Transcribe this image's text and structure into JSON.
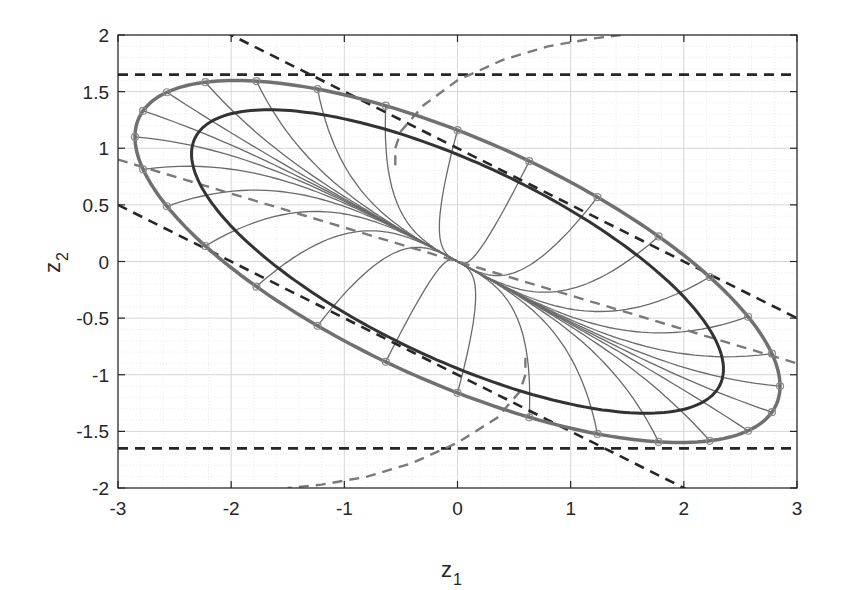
{
  "chart_data": {
    "type": "line",
    "title": "",
    "xlabel": "z",
    "xlabel_sub": "1",
    "ylabel": "z",
    "ylabel_sub": "2",
    "xlim": [
      -3,
      3
    ],
    "ylim": [
      -2,
      2
    ],
    "xticks": [
      -3,
      -2,
      -1,
      0,
      1,
      2,
      3
    ],
    "xtick_labels": [
      "-3",
      "-2",
      "-1",
      "0",
      "1",
      "2",
      "3"
    ],
    "yticks": [
      -2,
      -1.5,
      -1,
      -0.5,
      0,
      0.5,
      1,
      1.5,
      2
    ],
    "ytick_labels": [
      "-2",
      "-1.5",
      "-1",
      "-0.5",
      "0",
      "0.5",
      "1",
      "1.5",
      "2"
    ],
    "grid": "major+minor",
    "legend": null,
    "series": [
      {
        "name": "outer ellipse (with markers)",
        "kind": "ellipse",
        "color": "#707070",
        "width": 3.5,
        "param": {
          "X": 2.85,
          "Y1": 1.1,
          "Y2": 1.16
        },
        "markers": "circle",
        "marker_count": 28
      },
      {
        "name": "inner ellipse",
        "kind": "ellipse",
        "color": "#333333",
        "width": 3,
        "param": {
          "X": 2.35,
          "Y1": 0.95,
          "Y2": 0.945
        }
      },
      {
        "name": "trajectories",
        "kind": "trajectories",
        "color": "#6a6a6a",
        "width": 1.3,
        "count": 28,
        "converge_to": [
          0,
          0
        ]
      },
      {
        "name": "upper bound horizontal",
        "kind": "hline",
        "y": 1.65,
        "color": "#262626",
        "dash": "dashed"
      },
      {
        "name": "lower bound horizontal",
        "kind": "hline",
        "y": -1.65,
        "color": "#262626",
        "dash": "dashed"
      },
      {
        "name": "upper diagonal bound",
        "kind": "line",
        "slope": -0.5,
        "intercept": 1.0,
        "color": "#262626",
        "dash": "dashed"
      },
      {
        "name": "lower diagonal bound",
        "kind": "line",
        "slope": -0.5,
        "intercept": -1.0,
        "color": "#262626",
        "dash": "dashed"
      },
      {
        "name": "gray dashed line",
        "kind": "line",
        "slope": -0.3,
        "intercept": 0,
        "color": "#7a7a7a",
        "dash": "dashed"
      },
      {
        "name": "gray dashed curve upper",
        "kind": "curve",
        "points": [
          [
            -0.55,
            0.85
          ],
          [
            -0.55,
            1.0
          ],
          [
            -0.5,
            1.15
          ],
          [
            -0.3,
            1.38
          ],
          [
            0,
            1.6
          ],
          [
            0.4,
            1.78
          ],
          [
            0.8,
            1.9
          ],
          [
            1.2,
            1.97
          ],
          [
            1.45,
            2.0
          ]
        ],
        "color": "#7a7a7a",
        "dash": "dashed"
      },
      {
        "name": "gray dashed curve lower",
        "kind": "curve",
        "points": [
          [
            0.6,
            -0.85
          ],
          [
            0.6,
            -1.0
          ],
          [
            0.55,
            -1.15
          ],
          [
            0.35,
            -1.38
          ],
          [
            0.0,
            -1.6
          ],
          [
            -0.4,
            -1.78
          ],
          [
            -0.8,
            -1.9
          ],
          [
            -1.2,
            -1.97
          ],
          [
            -1.5,
            -2.0
          ]
        ],
        "color": "#7a7a7a",
        "dash": "dashed"
      }
    ]
  },
  "plot_area": {
    "left": 118,
    "top": 35,
    "right": 797,
    "bottom": 488
  }
}
